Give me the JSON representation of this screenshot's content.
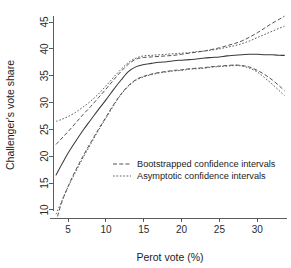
{
  "figure": {
    "top_cut_text": "",
    "width": 291,
    "height": 268
  },
  "chart_data": {
    "type": "line",
    "title": "",
    "xlabel": "Perot vote (%)",
    "ylabel": "Challenger's vote share",
    "xlim": [
      3.0,
      33.8
    ],
    "ylim": [
      8.5,
      46.5
    ],
    "xticks": [
      5,
      10,
      15,
      20,
      25,
      30
    ],
    "yticks": [
      10,
      15,
      20,
      25,
      30,
      35,
      40,
      45
    ],
    "grid": false,
    "legend_position": "center",
    "legend": [
      {
        "label": "Bootstrapped confidence intervals",
        "style": "dashed"
      },
      {
        "label": "Asymptotic confidence intervals",
        "style": "dotted"
      }
    ],
    "series": [
      {
        "name": "Fitted curve",
        "style": "solid",
        "x": [
          3.4,
          4.2,
          5.0,
          6.0,
          7.0,
          8.0,
          9.0,
          10.0,
          11.0,
          12.0,
          13.0,
          14.0,
          15.0,
          16.0,
          17.0,
          18.0,
          19.0,
          20.0,
          21.0,
          22.0,
          23.0,
          24.0,
          25.0,
          26.0,
          27.0,
          28.0,
          29.0,
          30.0,
          31.0,
          32.0,
          33.0,
          33.6
        ],
        "y": [
          16.5,
          18.6,
          20.6,
          22.8,
          24.9,
          26.8,
          28.7,
          30.5,
          32.4,
          34.2,
          35.8,
          36.7,
          37.1,
          37.3,
          37.5,
          37.6,
          37.8,
          37.9,
          38.0,
          38.1,
          38.3,
          38.4,
          38.5,
          38.7,
          38.8,
          38.9,
          39.0,
          39.0,
          38.9,
          38.9,
          38.8,
          38.8
        ]
      },
      {
        "name": "Bootstrapped upper",
        "style": "dashed",
        "x": [
          3.4,
          4.2,
          5.0,
          6.0,
          7.0,
          8.0,
          9.0,
          10.0,
          11.0,
          12.0,
          13.0,
          14.0,
          15.0,
          16.0,
          17.0,
          18.0,
          19.0,
          20.0,
          21.0,
          22.0,
          23.0,
          24.0,
          25.0,
          26.0,
          27.0,
          28.0,
          29.0,
          30.0,
          31.0,
          32.0,
          33.0,
          33.6
        ],
        "y": [
          22.2,
          23.4,
          24.6,
          26.2,
          27.8,
          29.3,
          30.9,
          32.5,
          34.2,
          35.8,
          37.2,
          38.1,
          38.4,
          38.5,
          38.6,
          38.7,
          38.8,
          39.0,
          39.2,
          39.4,
          39.6,
          39.9,
          40.2,
          40.6,
          41.0,
          41.5,
          42.2,
          43.0,
          43.9,
          44.8,
          45.6,
          46.1
        ]
      },
      {
        "name": "Bootstrapped lower",
        "style": "dashed",
        "x": [
          3.6,
          4.2,
          5.0,
          6.0,
          7.0,
          8.0,
          9.0,
          10.0,
          11.0,
          12.0,
          13.0,
          14.0,
          15.0,
          16.0,
          17.0,
          18.0,
          19.0,
          20.0,
          21.0,
          22.0,
          23.0,
          24.0,
          25.0,
          26.0,
          27.0,
          28.0,
          29.0,
          30.0,
          31.0,
          32.0,
          33.0,
          33.6
        ],
        "y": [
          8.8,
          11.6,
          14.4,
          17.4,
          20.1,
          22.6,
          25.0,
          27.3,
          29.6,
          31.6,
          33.2,
          34.3,
          34.9,
          35.3,
          35.6,
          35.8,
          36.0,
          36.1,
          36.3,
          36.4,
          36.5,
          36.7,
          36.8,
          36.9,
          37.0,
          36.9,
          36.6,
          36.0,
          35.2,
          34.2,
          33.0,
          32.2
        ]
      },
      {
        "name": "Asymptotic upper",
        "style": "dotted",
        "x": [
          3.4,
          4.2,
          5.0,
          6.0,
          7.0,
          8.0,
          9.0,
          10.0,
          11.0,
          12.0,
          13.0,
          14.0,
          15.0,
          16.0,
          17.0,
          18.0,
          19.0,
          20.0,
          21.0,
          22.0,
          23.0,
          24.0,
          25.0,
          26.0,
          27.0,
          28.0,
          29.0,
          30.0,
          31.0,
          32.0,
          33.0,
          33.6
        ],
        "y": [
          26.5,
          26.9,
          27.4,
          28.2,
          29.2,
          30.3,
          31.6,
          33.1,
          34.7,
          36.2,
          37.5,
          38.3,
          38.7,
          38.8,
          38.9,
          39.0,
          39.1,
          39.2,
          39.3,
          39.5,
          39.6,
          39.8,
          40.0,
          40.3,
          40.6,
          41.0,
          41.5,
          42.1,
          42.7,
          43.3,
          43.9,
          44.2
        ]
      },
      {
        "name": "Asymptotic lower",
        "style": "dotted",
        "x": [
          3.4,
          4.2,
          5.0,
          6.0,
          7.0,
          8.0,
          9.0,
          10.0,
          11.0,
          12.0,
          13.0,
          14.0,
          15.0,
          16.0,
          17.0,
          18.0,
          19.0,
          20.0,
          21.0,
          22.0,
          23.0,
          24.0,
          25.0,
          26.0,
          27.0,
          28.0,
          29.0,
          30.0,
          31.0,
          32.0,
          33.0,
          33.6
        ],
        "y": [
          9.2,
          11.8,
          14.3,
          17.1,
          19.8,
          22.3,
          24.8,
          27.1,
          29.4,
          31.5,
          33.1,
          34.2,
          34.8,
          35.2,
          35.5,
          35.7,
          35.9,
          36.0,
          36.2,
          36.3,
          36.4,
          36.6,
          36.7,
          36.8,
          36.9,
          36.8,
          36.4,
          35.7,
          34.6,
          33.4,
          32.1,
          31.3
        ]
      }
    ]
  }
}
